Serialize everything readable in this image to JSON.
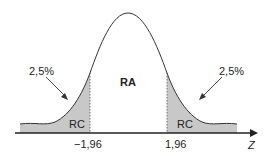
{
  "diagram": {
    "type": "normal-distribution",
    "center_region_label": "RA",
    "tail_region_label": "RC",
    "left_tail_percent": "2,5%",
    "right_tail_percent": "2,5%",
    "left_critical_value": "−1,96",
    "right_critical_value": "1,96",
    "axis_label": "Z",
    "colors": {
      "tail_fill": "#c8c8c8",
      "line": "#333333"
    }
  }
}
